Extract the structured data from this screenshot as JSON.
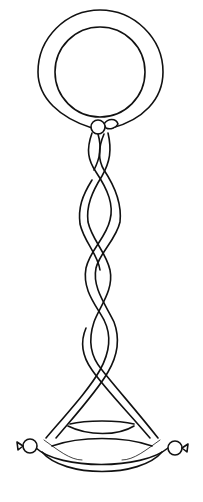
{
  "illustration": {
    "subject": "Balloon twist sculpture: ring on top, two-strand twisted braid, triangular loop base with knotted ends",
    "stroke_color": "#111111",
    "fill_color": "#ffffff",
    "background_color": "#ffffff",
    "parts": [
      "ring",
      "top-knot",
      "twisted-braid",
      "triangle-base",
      "left-knot",
      "right-knot"
    ]
  }
}
